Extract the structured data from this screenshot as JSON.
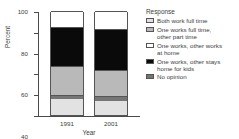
{
  "chart_data": {
    "type": "bar",
    "stacked": true,
    "title": "",
    "xlabel": "Year",
    "ylabel": "Percent",
    "categories": [
      "1991",
      "2001"
    ],
    "ylim": [
      0,
      100
    ],
    "yticks": [
      "0",
      "20",
      "40",
      "60",
      "80",
      "100"
    ],
    "grid": false,
    "legend_position": "right",
    "legend_title": "Response",
    "series": [
      {
        "name": "Both work full time",
        "color": "#e2e2e2",
        "values": [
          15,
          13
        ]
      },
      {
        "name": "No opinion",
        "color": "#757575",
        "values": [
          4,
          5
        ]
      },
      {
        "name": "One works full time, other part time",
        "color": "#b9b9b9",
        "values": [
          28,
          25
        ]
      },
      {
        "name": "One works, other stays home for kids",
        "color": "#0a0a0a",
        "values": [
          38,
          40
        ]
      },
      {
        "name": "One works, other works at home",
        "color": "#ffffff",
        "values": [
          15,
          17
        ]
      }
    ]
  },
  "axes": {
    "y_title": "Percent",
    "x_title": "Year",
    "y_ticks": [
      {
        "label": "100",
        "value": 100
      },
      {
        "label": "80",
        "value": 80
      },
      {
        "label": "60",
        "value": 60
      },
      {
        "label": "40",
        "value": 40
      },
      {
        "label": "20",
        "value": 20
      },
      {
        "label": "0",
        "value": 0
      }
    ]
  },
  "legend": {
    "title": "Response",
    "items": [
      {
        "label": "Both work full time",
        "swatch": "#e2e2e2"
      },
      {
        "label": "One works full time,\nother part time",
        "swatch": "#b9b9b9"
      },
      {
        "label": "One works, other works\nat home",
        "swatch": "#ffffff"
      },
      {
        "label": "One works, other stays\nhome for kids",
        "swatch": "#0a0a0a"
      },
      {
        "label": "No opinion",
        "swatch": "#757575"
      }
    ]
  },
  "bars": [
    {
      "category": "1991",
      "segments": [
        {
          "name": "Both work full time",
          "value": 15,
          "fill": "f-lightgray"
        },
        {
          "name": "No opinion",
          "value": 4,
          "fill": "f-darkgray"
        },
        {
          "name": "One works full time, other part time",
          "value": 28,
          "fill": "f-midgray"
        },
        {
          "name": "One works, other stays home for kids",
          "value": 38,
          "fill": "f-black"
        },
        {
          "name": "One works, other works at home",
          "value": 15,
          "fill": "f-white"
        }
      ]
    },
    {
      "category": "2001",
      "segments": [
        {
          "name": "Both work full time",
          "value": 13,
          "fill": "f-lightgray"
        },
        {
          "name": "No opinion",
          "value": 5,
          "fill": "f-darkgray"
        },
        {
          "name": "One works full time, other part time",
          "value": 25,
          "fill": "f-midgray"
        },
        {
          "name": "One works, other stays home for kids",
          "value": 40,
          "fill": "f-black"
        },
        {
          "name": "One works, other works at home",
          "value": 17,
          "fill": "f-white"
        }
      ]
    }
  ]
}
